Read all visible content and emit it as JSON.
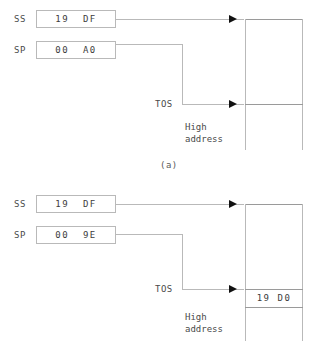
{
  "diagram": {
    "line_color": "#b9b9b9",
    "text_color": "#3d3d3d",
    "arrow_color": "#111111"
  },
  "panels": [
    {
      "caption": "(a)",
      "registers": [
        {
          "name": "SS",
          "value": "19  DF"
        },
        {
          "name": "SP",
          "value": "00  A0"
        }
      ],
      "pointer_label": "TOS",
      "address_label": "High\naddress",
      "memory_cells": []
    },
    {
      "caption": "",
      "registers": [
        {
          "name": "SS",
          "value": "19  DF"
        },
        {
          "name": "SP",
          "value": "00  9E"
        }
      ],
      "pointer_label": "TOS",
      "address_label": "High\naddress",
      "memory_cells": [
        {
          "value": "19 D0"
        }
      ]
    }
  ]
}
